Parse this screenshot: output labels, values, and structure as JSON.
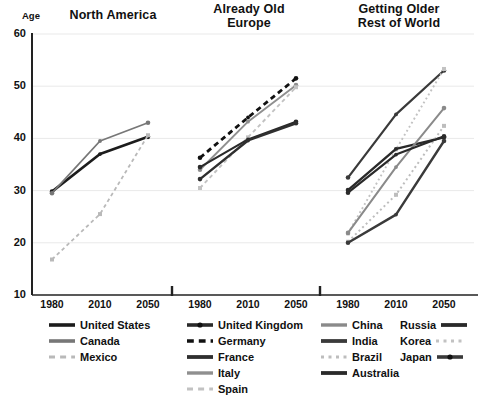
{
  "axis_name": "Age",
  "panels": [
    {
      "title_line1": "North America",
      "title_line2": ""
    },
    {
      "title_line1": "Already Old",
      "title_line2": "Europe"
    },
    {
      "title_line1": "Getting Older",
      "title_line2": "Rest of World"
    }
  ],
  "y_ticks": [
    "60",
    "50",
    "40",
    "30",
    "20",
    "10"
  ],
  "x_ticks": [
    "1980",
    "2010",
    "2050"
  ],
  "legend": {
    "columns": [
      {
        "align": "left",
        "items": [
          {
            "label": "United States",
            "style": "solid",
            "color": "#1c1c1c",
            "width": 3.6,
            "icon": "legend-line-solid"
          },
          {
            "label": "Canada",
            "style": "solid",
            "color": "#777777",
            "width": 3.6,
            "icon": "legend-line-solid"
          },
          {
            "label": "Mexico",
            "style": "dashed",
            "color": "#b9b9b9",
            "width": 3.0,
            "icon": "legend-line-dashed"
          }
        ]
      },
      {
        "align": "left",
        "items": [
          {
            "label": "United Kingdom",
            "style": "solid-dotmid",
            "color": "#2a2a2a",
            "width": 3.6,
            "icon": "legend-line-solid"
          },
          {
            "label": "Germany",
            "style": "dashed-thick",
            "color": "#111111",
            "width": 3.6,
            "icon": "legend-line-dashed"
          },
          {
            "label": "France",
            "style": "solid",
            "color": "#2f2f2f",
            "width": 3.8,
            "icon": "legend-line-solid"
          },
          {
            "label": "Italy",
            "style": "solid",
            "color": "#8f8f8f",
            "width": 3.4,
            "icon": "legend-line-solid"
          },
          {
            "label": "Spain",
            "style": "dashed",
            "color": "#c2c2c2",
            "width": 3.0,
            "icon": "legend-line-dashed"
          }
        ]
      },
      {
        "align": "left",
        "items": [
          {
            "label": "China",
            "style": "solid",
            "color": "#8a8a8a",
            "width": 3.4,
            "icon": "legend-line-solid"
          },
          {
            "label": "India",
            "style": "solid",
            "color": "#3a3a3a",
            "width": 3.8,
            "icon": "legend-line-solid"
          },
          {
            "label": "Brazil",
            "style": "dotted",
            "color": "#bdbdbd",
            "width": 3.0,
            "icon": "legend-line-dotted"
          },
          {
            "label": "Australia",
            "style": "solid",
            "color": "#2a2a2a",
            "width": 3.8,
            "icon": "legend-line-solid"
          }
        ]
      },
      {
        "align": "right",
        "items": [
          {
            "label": "Russia",
            "style": "solid",
            "color": "#2a2a2a",
            "width": 3.8,
            "icon": "legend-line-solid"
          },
          {
            "label": "Korea",
            "style": "dotted",
            "color": "#c2c2c2",
            "width": 3.0,
            "icon": "legend-line-dotted"
          },
          {
            "label": "Japan",
            "style": "solid-dotmid",
            "color": "#3a3a3a",
            "width": 3.6,
            "icon": "legend-line-solid"
          }
        ]
      }
    ]
  },
  "chart_data": {
    "type": "line",
    "xlabel": "",
    "ylabel": "Age",
    "ylim": [
      10,
      60
    ],
    "y_gridlines": [
      20,
      30,
      40,
      50,
      60
    ],
    "grid": true,
    "legend_position": "bottom",
    "x": [
      "1980",
      "2010",
      "2050"
    ],
    "panels": [
      {
        "name": "North America",
        "series": [
          {
            "name": "United States",
            "values": [
              29.8,
              37.0,
              40.3
            ],
            "style": "solid",
            "color": "#1c1c1c",
            "width": 2.6
          },
          {
            "name": "Canada",
            "values": [
              29.5,
              39.5,
              43.0
            ],
            "style": "solid",
            "color": "#777777",
            "width": 1.8
          },
          {
            "name": "Mexico",
            "values": [
              16.8,
              25.5,
              40.6
            ],
            "style": "dashed",
            "color": "#b9b9b9",
            "width": 1.8
          }
        ]
      },
      {
        "name": "Already Old - Europe",
        "series": [
          {
            "name": "Germany",
            "values": [
              36.3,
              44.0,
              51.5
            ],
            "style": "dashed-thick",
            "color": "#111111",
            "width": 2.8
          },
          {
            "name": "Italy",
            "values": [
              34.0,
              43.2,
              50.2
            ],
            "style": "solid",
            "color": "#8f8f8f",
            "width": 1.9
          },
          {
            "name": "Spain",
            "values": [
              30.5,
              40.2,
              49.8
            ],
            "style": "dashed",
            "color": "#c2c2c2",
            "width": 1.9
          },
          {
            "name": "United Kingdom",
            "values": [
              34.5,
              39.8,
              43.2
            ],
            "style": "solid-dotmid",
            "color": "#2a2a2a",
            "width": 2.1
          },
          {
            "name": "France",
            "values": [
              32.2,
              39.6,
              42.9
            ],
            "style": "solid",
            "color": "#2f2f2f",
            "width": 2.4
          }
        ]
      },
      {
        "name": "Getting Older - Rest of World",
        "series": [
          {
            "name": "Japan",
            "values": [
              32.5,
              44.6,
              53.0
            ],
            "style": "solid-dotmid",
            "color": "#3a3a3a",
            "width": 2.2
          },
          {
            "name": "Korea",
            "values": [
              21.8,
              37.9,
              53.3
            ],
            "style": "dotted",
            "color": "#c2c2c2",
            "width": 1.9
          },
          {
            "name": "Russia",
            "values": [
              30.1,
              38.0,
              40.2
            ],
            "style": "solid",
            "color": "#2a2a2a",
            "width": 2.4
          },
          {
            "name": "China",
            "values": [
              21.9,
              34.5,
              45.8
            ],
            "style": "solid",
            "color": "#8a8a8a",
            "width": 2.0
          },
          {
            "name": "Brazil",
            "values": [
              20.2,
              29.2,
              42.4
            ],
            "style": "dotted",
            "color": "#bdbdbd",
            "width": 2.0
          },
          {
            "name": "India",
            "values": [
              20.0,
              25.4,
              39.5
            ],
            "style": "solid",
            "color": "#3a3a3a",
            "width": 2.4
          },
          {
            "name": "Australia",
            "values": [
              29.6,
              36.9,
              40.4
            ],
            "style": "solid",
            "color": "#2a2a2a",
            "width": 2.2
          }
        ]
      }
    ]
  }
}
